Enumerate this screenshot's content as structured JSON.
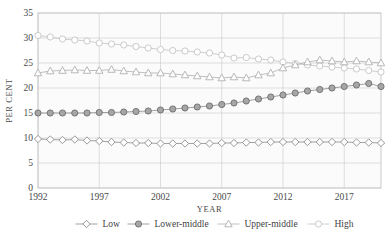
{
  "chart_data": {
    "type": "line",
    "title": "",
    "xlabel": "YEAR",
    "ylabel": "PER CENT",
    "xlim": [
      1992,
      2020
    ],
    "ylim": [
      0,
      35
    ],
    "ytick_values": [
      0,
      5,
      10,
      15,
      20,
      25,
      30,
      35
    ],
    "ytick_labels": [
      "0",
      "5",
      "10",
      "15",
      "20",
      "25",
      "30",
      "35"
    ],
    "xtick_values": [
      1992,
      1997,
      2002,
      2007,
      2012,
      2017
    ],
    "xtick_labels": [
      "1992",
      "1997",
      "2002",
      "2007",
      "2012",
      "2017"
    ],
    "grid": true,
    "legend_position": "bottom",
    "x": [
      1992,
      1993,
      1994,
      1995,
      1996,
      1997,
      1998,
      1999,
      2000,
      2001,
      2002,
      2003,
      2004,
      2005,
      2006,
      2007,
      2008,
      2009,
      2010,
      2011,
      2012,
      2013,
      2014,
      2015,
      2016,
      2017,
      2018,
      2019,
      2020
    ],
    "series": [
      {
        "name": "Low",
        "marker": "open-diamond",
        "color": "#8c8c8c",
        "values": [
          9.8,
          9.7,
          9.6,
          9.7,
          9.5,
          9.4,
          9.2,
          9.1,
          9.0,
          9.0,
          8.9,
          8.9,
          8.9,
          8.9,
          8.9,
          9.0,
          9.0,
          9.1,
          9.1,
          9.2,
          9.2,
          9.2,
          9.2,
          9.2,
          9.2,
          9.2,
          9.1,
          9.1,
          9.0
        ]
      },
      {
        "name": "Lower-middle",
        "marker": "filled-circle",
        "color": "#8a8a8a",
        "values": [
          15.0,
          15.0,
          15.0,
          15.0,
          15.0,
          15.1,
          15.1,
          15.2,
          15.3,
          15.4,
          15.6,
          15.8,
          16.0,
          16.2,
          16.4,
          16.7,
          17.0,
          17.4,
          17.8,
          18.2,
          18.6,
          19.0,
          19.4,
          19.7,
          20.0,
          20.3,
          20.6,
          20.9,
          20.3
        ]
      },
      {
        "name": "Upper-middle",
        "marker": "open-triangle",
        "color": "#b0b0b0",
        "values": [
          23.0,
          23.4,
          23.5,
          23.6,
          23.5,
          23.5,
          23.7,
          23.4,
          23.2,
          23.0,
          23.0,
          22.8,
          22.6,
          22.4,
          22.2,
          22.0,
          22.2,
          22.0,
          22.6,
          23.0,
          24.0,
          24.6,
          25.2,
          25.6,
          25.4,
          25.2,
          25.4,
          25.2,
          25.0
        ]
      },
      {
        "name": "High",
        "marker": "open-circle",
        "color": "#c4c4c4",
        "values": [
          30.5,
          30.2,
          29.8,
          29.6,
          29.4,
          29.0,
          28.8,
          28.6,
          28.3,
          28.0,
          27.7,
          27.5,
          27.4,
          27.2,
          27.0,
          26.6,
          26.0,
          26.1,
          25.8,
          25.6,
          25.2,
          24.9,
          24.6,
          24.4,
          24.2,
          24.0,
          23.8,
          23.5,
          23.2
        ]
      }
    ]
  },
  "legend": {
    "items": [
      {
        "label": "Low"
      },
      {
        "label": "Lower-middle"
      },
      {
        "label": "Upper-middle"
      },
      {
        "label": "High"
      }
    ]
  }
}
